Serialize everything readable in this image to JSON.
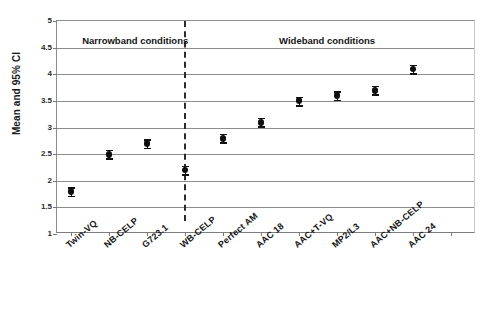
{
  "chart_data": {
    "type": "scatter",
    "title": "",
    "xlabel": "",
    "ylabel": "Mean and 95% CI",
    "ylim": [
      1,
      5
    ],
    "ytick_labels": [
      "1",
      "1.5",
      "2",
      "2.5",
      "3",
      "3.5",
      "4",
      "4.5",
      "5"
    ],
    "ytick_values": [
      1,
      1.5,
      2,
      2.5,
      3,
      3.5,
      4,
      4.5,
      5
    ],
    "grid": true,
    "legend_position": "none",
    "categories": [
      "Twin-VQ",
      "NB-CELP",
      "G723.1",
      "WB-CELP",
      "Perfect AM",
      "AAC 18",
      "AAC+T-VQ",
      "MP2/L3",
      "AAC+NB-CELP",
      "AAC 24"
    ],
    "values": [
      1.8,
      2.5,
      2.7,
      2.2,
      2.8,
      3.1,
      3.5,
      3.6,
      3.7,
      4.1
    ],
    "ci_lower": [
      1.72,
      2.42,
      2.62,
      2.12,
      2.72,
      3.02,
      3.42,
      3.52,
      3.62,
      4.02
    ],
    "ci_upper": [
      1.88,
      2.58,
      2.78,
      2.28,
      2.88,
      3.18,
      3.58,
      3.68,
      3.78,
      4.18
    ],
    "error_half_width": 0.08,
    "annotations": [
      {
        "text": "Narrowband conditions",
        "x_frac": 0.06,
        "y": 4.62
      },
      {
        "text": "Wideband conditions",
        "x_frac": 0.53,
        "y": 4.62
      }
    ],
    "divider": {
      "type": "dashed-vertical",
      "x_frac": 0.303
    }
  },
  "annotations": {
    "narrowband": "Narrowband conditions",
    "wideband": "Wideband conditions"
  },
  "axis": {
    "y_title": "Mean and 95% CI"
  }
}
